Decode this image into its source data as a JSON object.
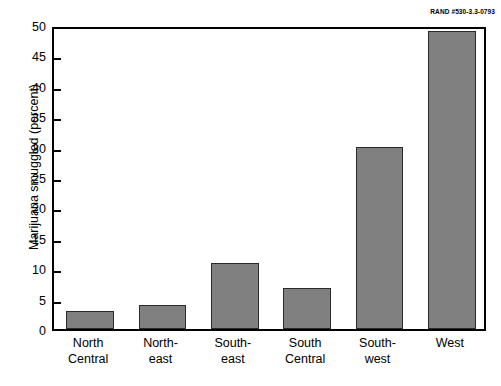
{
  "source_id": "RAND #530-3.3-0793",
  "chart_data": {
    "type": "bar",
    "title": "",
    "xlabel": "",
    "ylabel": "Marijuana smuggled (percent)",
    "categories": [
      "North Central",
      "North-east",
      "South-east",
      "South Central",
      "South-west",
      "West"
    ],
    "category_lines": [
      [
        "North",
        "Central"
      ],
      [
        "North-",
        "east"
      ],
      [
        "South-",
        "east"
      ],
      [
        "South",
        "Central"
      ],
      [
        "South-",
        "west"
      ],
      [
        "West"
      ]
    ],
    "values": [
      3.0,
      4.0,
      10.8,
      6.8,
      30.0,
      49.0
    ],
    "ylim": [
      0,
      50
    ],
    "yticks": [
      0,
      5,
      10,
      15,
      20,
      25,
      30,
      35,
      40,
      45,
      50
    ],
    "ytick_labels": [
      "0",
      "5",
      "10",
      "15",
      "20",
      "25",
      "30",
      "35",
      "40",
      "45",
      "50"
    ],
    "grid": false,
    "legend": "none",
    "bar_color": "#808080",
    "bar_edge_color": "#2b2b2b",
    "axis_color": "#000000",
    "background": "#ffffff"
  }
}
